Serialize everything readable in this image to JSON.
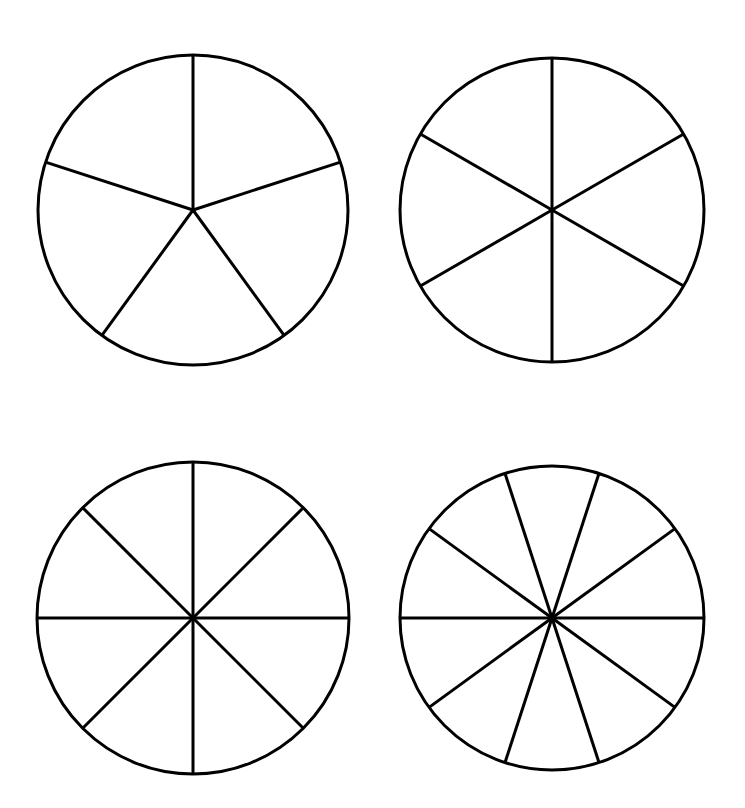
{
  "page": {
    "background_color": "#ffffff",
    "stroke_color": "#000000",
    "fill_color": "#ffffff",
    "width": 745,
    "height": 808
  },
  "chart_data": {
    "type": "pie",
    "legend": "none",
    "grid": false,
    "figures": [
      {
        "name": "circle-fifths",
        "label": "Circle divided into fifths",
        "position": "top-left",
        "center_x": 193,
        "center_y": 210,
        "radius": 155,
        "slices": 5,
        "slice_angle_deg": 72,
        "fraction_each": "1/5",
        "start_angle_deg": -90,
        "stroke_width": 3,
        "values": [
          20,
          20,
          20,
          20,
          20
        ],
        "labels": [
          "1/5",
          "1/5",
          "1/5",
          "1/5",
          "1/5"
        ]
      },
      {
        "name": "circle-sixths",
        "label": "Circle divided into sixths",
        "position": "top-right",
        "center_x": 552,
        "center_y": 210,
        "radius": 152,
        "slices": 6,
        "slice_angle_deg": 60,
        "fraction_each": "1/6",
        "start_angle_deg": -90,
        "stroke_width": 3,
        "values": [
          16.67,
          16.67,
          16.67,
          16.67,
          16.67,
          16.67
        ],
        "labels": [
          "1/6",
          "1/6",
          "1/6",
          "1/6",
          "1/6",
          "1/6"
        ]
      },
      {
        "name": "circle-eighths",
        "label": "Circle divided into eighths",
        "position": "bottom-left",
        "center_x": 193,
        "center_y": 618,
        "radius": 156,
        "slices": 8,
        "slice_angle_deg": 45,
        "fraction_each": "1/8",
        "start_angle_deg": -90,
        "stroke_width": 3,
        "values": [
          12.5,
          12.5,
          12.5,
          12.5,
          12.5,
          12.5,
          12.5,
          12.5
        ],
        "labels": [
          "1/8",
          "1/8",
          "1/8",
          "1/8",
          "1/8",
          "1/8",
          "1/8",
          "1/8"
        ]
      },
      {
        "name": "circle-tenths",
        "label": "Circle divided into tenths",
        "position": "bottom-right",
        "center_x": 552,
        "center_y": 618,
        "radius": 152,
        "slices": 10,
        "slice_angle_deg": 36,
        "fraction_each": "1/10",
        "start_angle_deg": 0,
        "stroke_width": 3,
        "values": [
          10,
          10,
          10,
          10,
          10,
          10,
          10,
          10,
          10,
          10
        ],
        "labels": [
          "1/10",
          "1/10",
          "1/10",
          "1/10",
          "1/10",
          "1/10",
          "1/10",
          "1/10",
          "1/10",
          "1/10"
        ]
      }
    ]
  }
}
